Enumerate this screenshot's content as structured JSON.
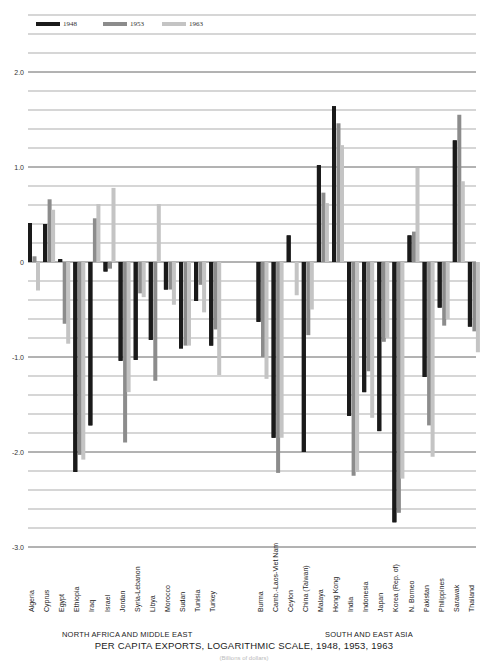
{
  "legend": [
    {
      "label": "1948",
      "color": "#1a1a1a"
    },
    {
      "label": "1953",
      "color": "#8c8c8c"
    },
    {
      "label": "1963",
      "color": "#c4c4c4"
    }
  ],
  "group_labels": {
    "left": "NORTH AFRICA AND MIDDLE EAST",
    "right": "SOUTH AND EAST ASIA"
  },
  "title": "PER CAPITA EXPORTS, LOGARITHMIC SCALE, 1948, 1953, 1963",
  "footnote": "(Billions of dollars)",
  "chart_data": {
    "type": "bar",
    "title": "PER CAPITA EXPORTS, LOGARITHMIC SCALE, 1948, 1953, 1963",
    "xlabel": "",
    "ylabel": "",
    "ylim": [
      -3.0,
      2.6
    ],
    "yticks": [
      {
        "value": 2.0,
        "label": "2.0"
      },
      {
        "value": 1.0,
        "label": "1.0"
      },
      {
        "value": 0,
        "label": "0"
      },
      {
        "value": -1.0,
        "label": "-1.0"
      },
      {
        "value": -2.0,
        "label": "-2.0"
      },
      {
        "value": -3.0,
        "label": "-3.0"
      }
    ],
    "grid": true,
    "grid_step": 0.2,
    "legend_position": "top-left",
    "groups": [
      {
        "name": "NORTH AFRICA AND MIDDLE EAST",
        "categories": [
          "Algeria",
          "Cyprus",
          "Egypt",
          "Ethiopia",
          "Iraq",
          "Israel",
          "Jordan",
          "Syria-Lebanon",
          "Libya",
          "Morocco",
          "Sudan",
          "Tunisia",
          "Turkey"
        ]
      },
      {
        "name": "SOUTH AND EAST ASIA",
        "categories": [
          "Burma",
          "Camb.-Laos-Viet Nam",
          "Ceylon",
          "China (Taiwan)",
          "Malaya",
          "Hong Kong",
          "India",
          "Indonesia",
          "Japan",
          "Korea (Rep. of)",
          "N. Borneo",
          "Pakistan",
          "Philippines",
          "Sarawak",
          "Thailand"
        ]
      }
    ],
    "categories": [
      "Algeria",
      "Cyprus",
      "Egypt",
      "Ethiopia",
      "Iraq",
      "Israel",
      "Jordan",
      "Syria-Lebanon",
      "Libya",
      "Morocco",
      "Sudan",
      "Tunisia",
      "Turkey",
      "Burma",
      "Camb.-Laos-Viet Nam",
      "Ceylon",
      "China (Taiwan)",
      "Malaya",
      "Hong Kong",
      "India",
      "Indonesia",
      "Japan",
      "Korea (Rep. of)",
      "N. Borneo",
      "Pakistan",
      "Philippines",
      "Sarawak",
      "Thailand"
    ],
    "series": [
      {
        "name": "1948",
        "color": "#1a1a1a",
        "values": [
          0.41,
          0.4,
          0.03,
          -2.21,
          -1.72,
          -0.1,
          -1.04,
          -1.03,
          -0.82,
          -0.29,
          -0.91,
          -0.41,
          -0.88,
          -0.63,
          -1.85,
          0.28,
          -2.0,
          1.02,
          1.64,
          -1.62,
          -1.37,
          -1.78,
          -2.74,
          0.28,
          -1.21,
          -0.48,
          1.28,
          -0.68
        ]
      },
      {
        "name": "1953",
        "color": "#8c8c8c",
        "values": [
          0.06,
          0.66,
          -0.65,
          -2.03,
          0.46,
          -0.07,
          -1.9,
          -0.33,
          -1.25,
          -0.29,
          -0.88,
          -0.24,
          -0.71,
          -1.0,
          -2.22,
          0.0,
          -0.77,
          0.73,
          1.46,
          -2.25,
          -1.15,
          -0.84,
          -2.64,
          0.32,
          -1.72,
          -0.67,
          1.55,
          -0.73
        ]
      },
      {
        "name": "1963",
        "color": "#c4c4c4",
        "values": [
          -0.3,
          0.55,
          -0.86,
          -2.08,
          0.61,
          0.78,
          -1.37,
          -0.37,
          0.61,
          -0.45,
          -0.88,
          -0.53,
          -1.19,
          -1.23,
          -1.85,
          -0.35,
          -0.5,
          0.62,
          1.23,
          -2.21,
          -1.64,
          -0.8,
          -2.28,
          0.99,
          -2.05,
          -0.6,
          0.85,
          -0.95
        ]
      }
    ]
  }
}
